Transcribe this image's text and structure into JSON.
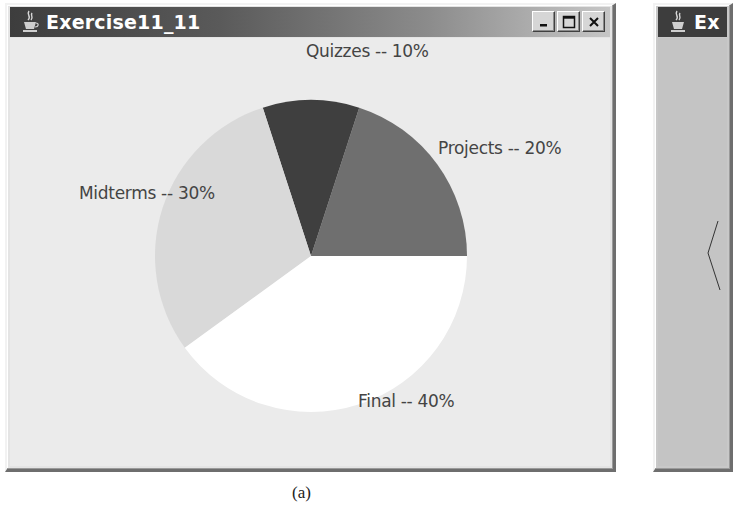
{
  "windows": [
    {
      "title": "Exercise11_11",
      "controls": {
        "minimize": "minimize",
        "maximize": "maximize",
        "close": "close"
      },
      "icon": "java-cup-icon"
    },
    {
      "title": "Ex",
      "icon": "java-cup-icon"
    }
  ],
  "labels": {
    "projects": "Projects -- 20%",
    "quizzes": "Quizzes -- 10%",
    "midterms": "Midterms -- 30%",
    "final": "Final -- 40%"
  },
  "caption": "(a)",
  "colors": {
    "projects": "#6f6f6f",
    "quizzes": "#3f3f3f",
    "midterms": "#d9d9d9",
    "final": "#ffffff",
    "background": "#ebebeb"
  },
  "chart_data": {
    "type": "pie",
    "title": "Exercise11_11",
    "categories": [
      "Projects",
      "Quizzes",
      "Midterms",
      "Final"
    ],
    "values": [
      20,
      10,
      30,
      40
    ],
    "labels": [
      "Projects -- 20%",
      "Quizzes -- 10%",
      "Midterms -- 30%",
      "Final -- 40%"
    ],
    "start_angle_deg": 0,
    "direction": "counterclockwise",
    "legend": "none (inline labels)"
  }
}
